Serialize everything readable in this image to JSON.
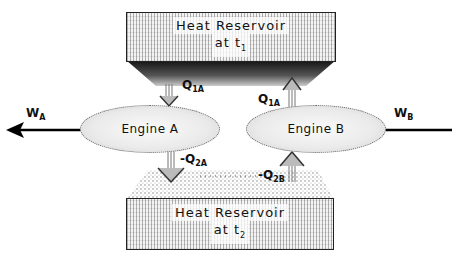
{
  "diagram": {
    "top_reservoir": {
      "title": "Heat Reservoir",
      "sub_prefix": "at t",
      "sub_index": "1"
    },
    "bottom_reservoir": {
      "title": "Heat Reservoir",
      "sub_prefix": "at t",
      "sub_index": "2"
    },
    "engine_a": {
      "label": "Engine A"
    },
    "engine_b": {
      "label": "Engine B"
    },
    "flows": {
      "q1a_into_a": {
        "prefix": "Q",
        "sub": "1A"
      },
      "q1a_out_of_b": {
        "prefix": "Q",
        "sub": "1A"
      },
      "q2a": {
        "prefix": "-Q",
        "sub": "2A"
      },
      "q2b": {
        "prefix": "-Q",
        "sub": "2B"
      }
    },
    "work": {
      "wa": {
        "prefix": "W",
        "sub": "A"
      },
      "wb": {
        "prefix": "W",
        "sub": "B"
      }
    }
  }
}
